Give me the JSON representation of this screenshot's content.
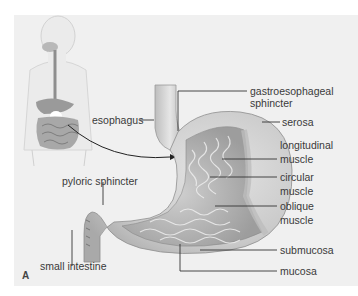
{
  "figure": {
    "panel_letter": "A",
    "labels": {
      "esophagus": "esophagus",
      "gastroesophageal_1": "gastroesophageal",
      "gastroesophageal_2": "sphincter",
      "serosa": "serosa",
      "longitudinal_1": "longitudinal",
      "longitudinal_2": "muscle",
      "circular_1": "circular",
      "circular_2": "muscle",
      "oblique_1": "oblique",
      "oblique_2": "muscle",
      "pyloric": "pyloric sphincter",
      "submucosa": "submucosa",
      "mucosa": "mucosa",
      "small_intestine": "small intestine"
    },
    "colors": {
      "background": "#f0f0f0",
      "line": "#333333",
      "text": "#3a3a3a"
    }
  }
}
